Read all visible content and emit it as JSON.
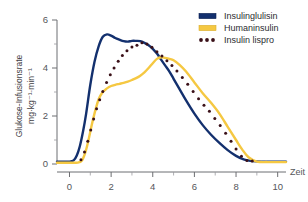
{
  "chart_data": {
    "type": "line",
    "title": "",
    "xlabel": "Zeit",
    "ylabel": "Glukose-Infusionsrate",
    "ylabel_units": "mg·kg⁻¹·min⁻¹",
    "xlim": [
      -0.6,
      10.4
    ],
    "ylim": [
      0,
      6
    ],
    "xticks": [
      0,
      2,
      4,
      6,
      8,
      10
    ],
    "xtick_labels": [
      "0",
      "2",
      "4",
      "6",
      "8",
      "10"
    ],
    "xminor_ticks": [
      1,
      3,
      5,
      7,
      9
    ],
    "yticks": [
      0,
      2,
      4,
      6
    ],
    "ytick_labels": [
      "0",
      "2",
      "4",
      "6"
    ],
    "yminor_ticks": [
      1,
      3,
      5
    ],
    "grid": false,
    "legend_position": "top-right",
    "series": [
      {
        "name": "Insulinglulisin",
        "color": "#13306e",
        "style": "solid",
        "x": [
          -0.6,
          0.0,
          0.2,
          0.35,
          0.5,
          0.65,
          0.8,
          1.0,
          1.2,
          1.4,
          1.6,
          1.8,
          2.0,
          2.2,
          2.4,
          2.6,
          2.8,
          3.0,
          3.2,
          3.4,
          3.6,
          3.8,
          4.0,
          4.2,
          4.4,
          4.6,
          4.8,
          5.0,
          5.3,
          5.6,
          6.0,
          6.4,
          6.8,
          7.2,
          7.6,
          8.0,
          8.4,
          8.8,
          9.2,
          9.6,
          10.0,
          10.4
        ],
        "y": [
          0.1,
          0.1,
          0.15,
          0.35,
          0.75,
          1.35,
          2.1,
          3.3,
          4.25,
          4.9,
          5.3,
          5.4,
          5.35,
          5.25,
          5.18,
          5.12,
          5.1,
          5.13,
          5.13,
          5.12,
          5.05,
          4.95,
          4.8,
          4.6,
          4.35,
          4.1,
          3.85,
          3.55,
          3.1,
          2.65,
          2.1,
          1.62,
          1.22,
          0.88,
          0.58,
          0.34,
          0.18,
          0.12,
          0.1,
          0.1,
          0.1,
          0.1
        ]
      },
      {
        "name": "Humaninsulin",
        "color": "#f5c842",
        "style": "solid",
        "x": [
          -0.6,
          0.0,
          0.4,
          0.6,
          0.75,
          0.9,
          1.05,
          1.2,
          1.4,
          1.6,
          1.8,
          2.0,
          2.2,
          2.4,
          2.6,
          2.8,
          3.0,
          3.2,
          3.4,
          3.6,
          3.8,
          4.0,
          4.2,
          4.4,
          4.6,
          4.8,
          5.0,
          5.3,
          5.6,
          6.0,
          6.4,
          6.8,
          7.2,
          7.6,
          8.0,
          8.3,
          8.6,
          9.0,
          9.5,
          10.0,
          10.4
        ],
        "y": [
          0.05,
          0.05,
          0.06,
          0.15,
          0.45,
          0.95,
          1.55,
          2.1,
          2.7,
          3.0,
          3.15,
          3.25,
          3.3,
          3.34,
          3.38,
          3.43,
          3.5,
          3.58,
          3.68,
          3.82,
          4.0,
          4.2,
          4.38,
          4.45,
          4.42,
          4.38,
          4.32,
          4.12,
          3.85,
          3.4,
          2.95,
          2.55,
          2.1,
          1.55,
          1.0,
          0.6,
          0.28,
          0.1,
          0.08,
          0.08,
          0.08
        ]
      },
      {
        "name": "Insulin lispro",
        "color": "#3a1018",
        "style": "dotted",
        "x": [
          0.55,
          0.72,
          0.88,
          1.02,
          1.16,
          1.3,
          1.45,
          1.6,
          1.78,
          1.96,
          2.14,
          2.34,
          2.54,
          2.76,
          3.0,
          3.24,
          3.48,
          3.72,
          3.96,
          4.2,
          4.44,
          4.68,
          4.92,
          5.16,
          5.42,
          5.68,
          5.94,
          6.2,
          6.46,
          6.72,
          6.98,
          7.24,
          7.5,
          7.76,
          8.0,
          8.26,
          8.52,
          8.78
        ],
        "y": [
          0.18,
          0.5,
          0.95,
          1.42,
          1.88,
          2.3,
          2.68,
          3.02,
          3.4,
          3.72,
          4.0,
          4.28,
          4.52,
          4.72,
          4.88,
          4.95,
          5.05,
          5.0,
          4.86,
          4.68,
          4.5,
          4.3,
          4.1,
          3.88,
          3.6,
          3.32,
          3.02,
          2.72,
          2.45,
          2.2,
          1.9,
          1.6,
          1.28,
          0.95,
          0.62,
          0.32,
          0.15,
          0.12
        ]
      }
    ]
  },
  "legend": {
    "items": [
      {
        "label": "Insulinglulisin",
        "color": "#13306e",
        "marker": "solid-bar"
      },
      {
        "label": "Humaninsulin",
        "color": "#f5c842",
        "marker": "solid-bar"
      },
      {
        "label": "Insulin lispro",
        "color": "#3a1018",
        "marker": "dotted-bar"
      }
    ]
  }
}
